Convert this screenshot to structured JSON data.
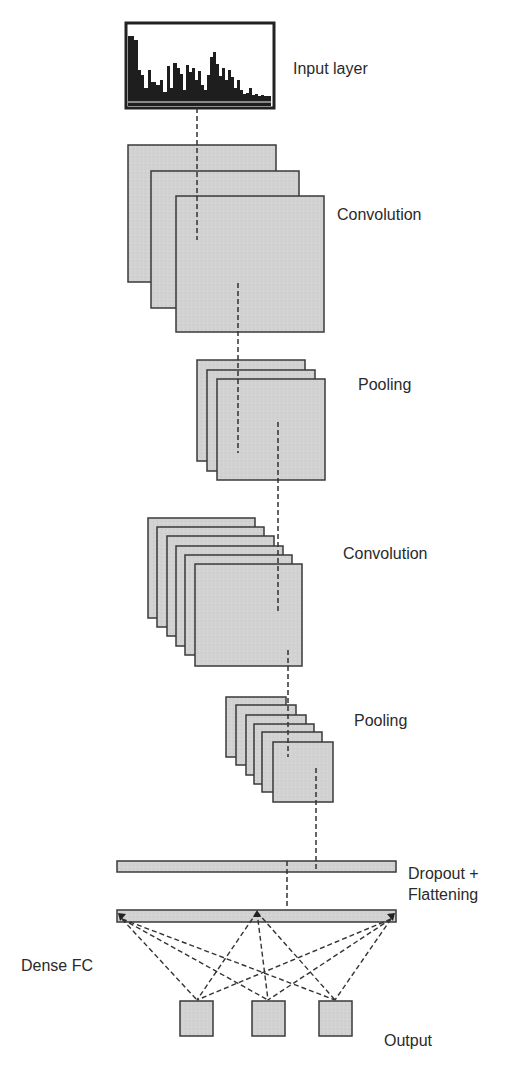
{
  "diagram": {
    "labels": {
      "input": "Input layer",
      "conv1": "Convolution",
      "pool1": "Pooling",
      "conv2": "Convolution",
      "pool2": "Pooling",
      "dropout_line1": "Dropout +",
      "dropout_line2": "Flattening",
      "dense": "Dense FC",
      "output": "Output"
    },
    "layers": [
      {
        "name": "Input layer",
        "type": "spectrum",
        "maps": 1
      },
      {
        "name": "Convolution",
        "type": "feature-maps",
        "maps": 3
      },
      {
        "name": "Pooling",
        "type": "feature-maps",
        "maps": 3
      },
      {
        "name": "Convolution",
        "type": "feature-maps",
        "maps": 6
      },
      {
        "name": "Pooling",
        "type": "feature-maps",
        "maps": 6
      },
      {
        "name": "Dropout + Flattening",
        "type": "vector"
      },
      {
        "name": "Dense FC",
        "type": "vector"
      },
      {
        "name": "Output",
        "type": "nodes",
        "count": 3
      }
    ],
    "colors": {
      "map_fill": "#cfcfcf",
      "map_stroke": "#3a3a3a",
      "dashed": "#333333"
    }
  }
}
